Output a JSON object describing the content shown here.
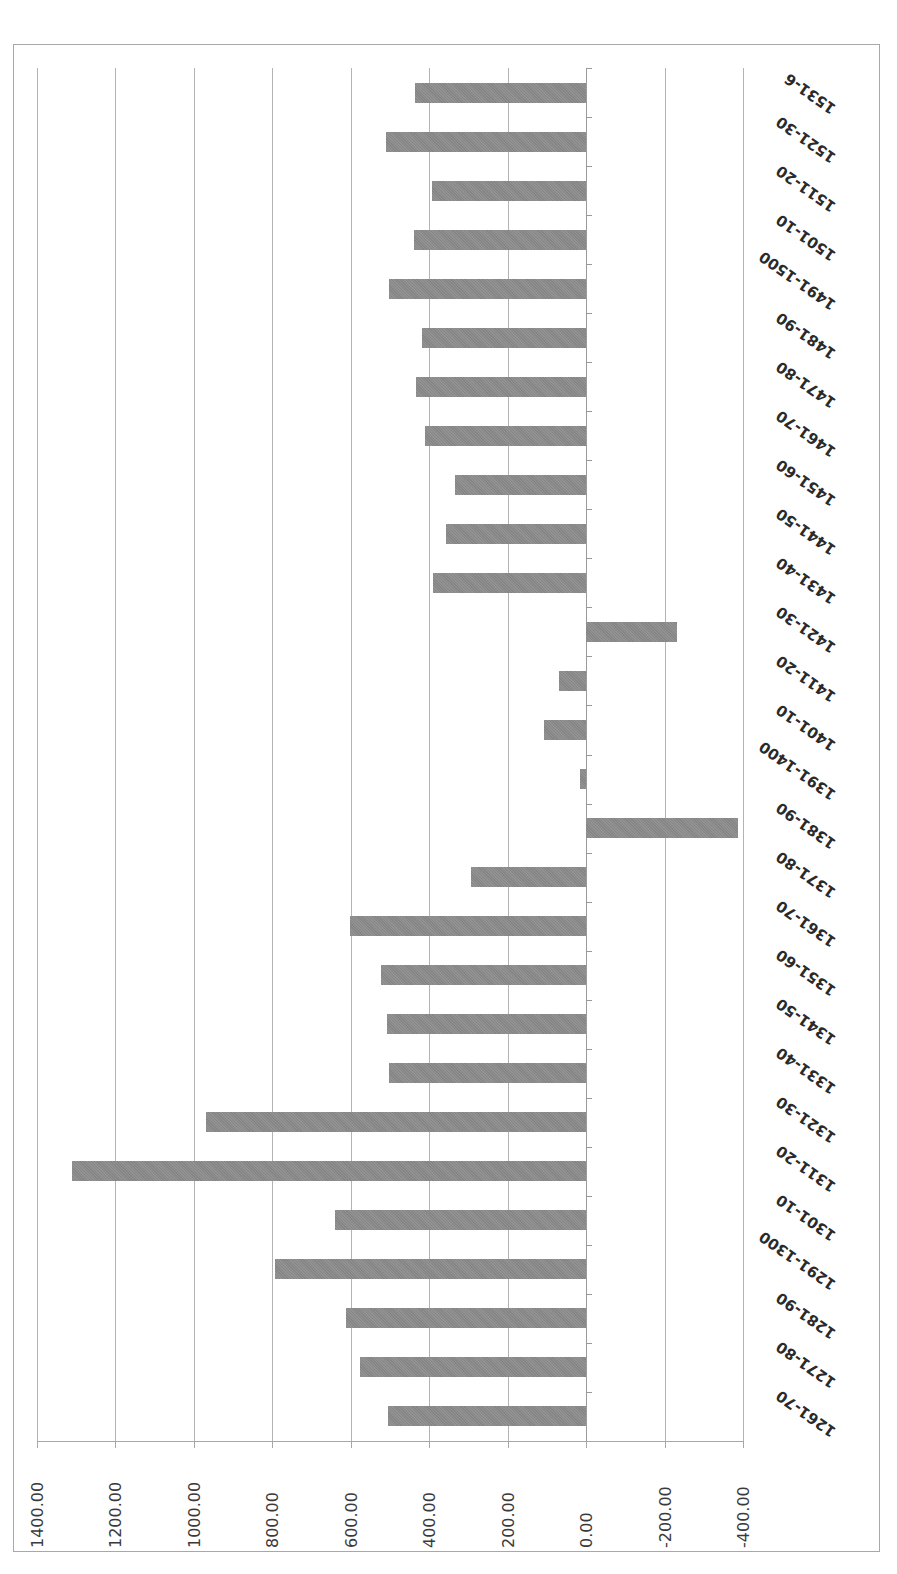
{
  "chart_data": {
    "type": "bar",
    "orientation": "horizontal (image rotated 90 degrees)",
    "title": "",
    "xlabel": "",
    "ylabel": "",
    "value_axis": {
      "min": -400,
      "max": 1400,
      "step": 200,
      "tick_labels": [
        "1400.00",
        "1200.00",
        "1000.00",
        "800.00",
        "600.00",
        "400.00",
        "200.00",
        "0.00",
        "-200.00",
        "-400.00"
      ],
      "gridlines": true
    },
    "categories": [
      "1261-70",
      "1271-80",
      "1281-90",
      "1291-1300",
      "1301-10",
      "1311-20",
      "1321-30",
      "1331-40",
      "1341-50",
      "1351-60",
      "1361-70",
      "1371-80",
      "1381-90",
      "1391-1400",
      "1401-10",
      "1411-20",
      "1421-30",
      "1431-40",
      "1441-50",
      "1451-60",
      "1461-70",
      "1471-80",
      "1481-90",
      "1491-1500",
      "1501-10",
      "1511-20",
      "1521-30",
      "1531-6"
    ],
    "values": [
      506,
      577,
      613,
      794,
      641,
      1311,
      969,
      503,
      507,
      523,
      601,
      294,
      -386,
      16,
      107,
      69,
      -231,
      390,
      356,
      335,
      410,
      434,
      418,
      503,
      440,
      393,
      510,
      437
    ],
    "legend": null,
    "colors": {
      "bar": "#8c8c8c",
      "gridline": "#b3b3b3",
      "frame": "#a8a8a8",
      "text": "#3a3a3a"
    }
  }
}
